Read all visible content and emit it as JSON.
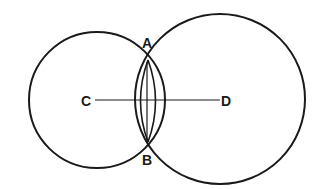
{
  "diagram": {
    "type": "geometry-construction",
    "colors": {
      "background": "#ffffff",
      "ink": "#1a1a1a"
    },
    "circles": [
      {
        "id": "circle-c",
        "center_label": "C",
        "cx": 97,
        "cy": 100,
        "r": 68
      },
      {
        "id": "circle-d",
        "center_label": "D",
        "cx": 220,
        "cy": 99,
        "r": 85
      }
    ],
    "points": {
      "A": {
        "label": "A",
        "x": 148,
        "y": 60
      },
      "B": {
        "label": "B",
        "x": 148,
        "y": 142
      },
      "C": {
        "label": "C",
        "x": 94,
        "y": 100
      },
      "D": {
        "label": "D",
        "x": 221,
        "y": 100
      }
    },
    "segments": [
      {
        "from": "C",
        "to": "D"
      },
      {
        "from": "A",
        "to": "B"
      }
    ]
  }
}
